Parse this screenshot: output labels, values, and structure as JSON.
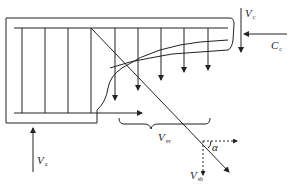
{
  "diagram": {
    "colors": {
      "line": "#222222",
      "background": "#ffffff"
    },
    "labels": {
      "Vc": {
        "main": "V",
        "sub": "c"
      },
      "Cc": {
        "main": "C",
        "sub": "c"
      },
      "Va": {
        "main": "V",
        "sub": "a"
      },
      "Vsv": {
        "main": "V",
        "sub": "sv"
      },
      "Vsb": {
        "main": "V",
        "sub": "sb"
      },
      "alpha": "α"
    },
    "elements": [
      "beam-outline",
      "top-longitudinal-bar",
      "bottom-longitudinal-bar",
      "stirrups-left-4",
      "stirrups-cut-arrows-4",
      "bent-up-bar",
      "inclined-crack",
      "compression-zone",
      "shear-force-Vc-arrow",
      "compression-force-Cc-arrow",
      "support-reaction-Va-arrow",
      "longitudinal-bar-tension-arrow",
      "stirrup-force-brace",
      "bent-bar-horizontal-component",
      "bent-bar-vertical-component",
      "angle-alpha-arc"
    ]
  }
}
